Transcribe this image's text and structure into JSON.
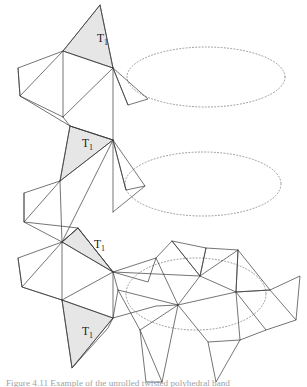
{
  "figure": {
    "caption": "Figure 4.11 Example of the unrolled twisted polyhedral band",
    "stroke_color": "#3a3a3a",
    "shade_color": "#e6e6e6",
    "dotted_color": "#8a8a8a",
    "background": "#ffffff",
    "labels": [
      {
        "id": "label-t1-top",
        "text": "T",
        "subscript": "1",
        "x": 97,
        "y": 42
      },
      {
        "id": "label-t1-second",
        "text": "T",
        "subscript": "1",
        "x": 82,
        "y": 147
      },
      {
        "id": "label-t1-third",
        "text": "T",
        "subscript": "1",
        "x": 94,
        "y": 248
      },
      {
        "id": "label-t1-fourth",
        "text": "T",
        "subscript": "1",
        "x": 82,
        "y": 335
      }
    ],
    "shaded_triangles": [
      {
        "id": "shaded-triangle-1",
        "points": "100,5 63,51 113,68"
      },
      {
        "id": "shaded-triangle-2",
        "points": "70,126 113,140 60,181"
      },
      {
        "id": "shaded-triangle-3",
        "points": "78,228 113,272 62,242"
      },
      {
        "id": "shaded-triangle-4",
        "points": "62,300 113,318 72,368"
      }
    ],
    "ellipses": [
      {
        "id": "cross-section-ellipse-1",
        "cx": 206,
        "cy": 77,
        "rx": 79,
        "ry": 30
      },
      {
        "id": "cross-section-ellipse-2",
        "cx": 203,
        "cy": 184,
        "rx": 78,
        "ry": 32
      },
      {
        "id": "cross-section-ellipse-3",
        "cx": 196,
        "cy": 294,
        "rx": 70,
        "ry": 36
      }
    ],
    "mesh_polylines": [
      {
        "id": "strip-seg-a1",
        "points": "100,5 63,51 113,68 100,5"
      },
      {
        "id": "strip-seg-a2",
        "points": "63,51 18,68 20,96 63,51"
      },
      {
        "id": "strip-seg-a3",
        "points": "18,68 20,96 63,117"
      },
      {
        "id": "strip-seg-a4",
        "points": "63,51 63,117"
      },
      {
        "id": "strip-seg-a5",
        "points": "63,117 113,68"
      },
      {
        "id": "strip-seg-a6",
        "points": "113,68 113,140"
      },
      {
        "id": "strip-seg-a7",
        "points": "63,117 70,126 113,140"
      },
      {
        "id": "strip-seg-a8",
        "points": "113,68 148,99 128,105 113,68"
      },
      {
        "id": "strip-seg-a9",
        "points": "113,68 128,105"
      },
      {
        "id": "strip-seg-a10",
        "points": "20,96 70,126"
      },
      {
        "id": "strip-seg-b1",
        "points": "70,126 113,140 60,181 70,126"
      },
      {
        "id": "strip-seg-b2",
        "points": "60,181 24,193 24,222 60,181"
      },
      {
        "id": "strip-seg-b3",
        "points": "24,193 24,222 62,242"
      },
      {
        "id": "strip-seg-b4",
        "points": "60,181 62,242"
      },
      {
        "id": "strip-seg-b5",
        "points": "62,242 113,140"
      },
      {
        "id": "strip-seg-b6",
        "points": "113,140 113,212"
      },
      {
        "id": "strip-seg-b7",
        "points": "113,140 145,186 126,190 113,140"
      },
      {
        "id": "strip-seg-b8",
        "points": "113,140 126,190"
      },
      {
        "id": "strip-seg-b9",
        "points": "24,222 78,228"
      },
      {
        "id": "strip-seg-b10",
        "points": "62,242 78,228 113,272"
      },
      {
        "id": "strip-seg-b11",
        "points": "113,212 145,186"
      },
      {
        "id": "strip-seg-c1",
        "points": "78,228 113,272 62,242 78,228"
      },
      {
        "id": "strip-seg-c2",
        "points": "62,242 18,258 22,287 62,242"
      },
      {
        "id": "strip-seg-c3",
        "points": "18,258 22,287 62,300"
      },
      {
        "id": "strip-seg-c4",
        "points": "62,242 62,300"
      },
      {
        "id": "strip-seg-c5",
        "points": "62,300 113,272"
      },
      {
        "id": "strip-seg-c6",
        "points": "113,272 113,318"
      },
      {
        "id": "strip-seg-c7",
        "points": "62,300 72,368 113,318 62,300"
      },
      {
        "id": "strip-seg-c8",
        "points": "72,368 108,328 113,318"
      },
      {
        "id": "strip-seg-c9",
        "points": "22,287 62,300"
      },
      {
        "id": "unroll-1",
        "points": "113,272 156,258 178,305 118,290 113,272"
      },
      {
        "id": "unroll-2",
        "points": "156,258 172,241 200,276 178,305"
      },
      {
        "id": "unroll-3",
        "points": "172,241 200,276 206,248 172,241"
      },
      {
        "id": "unroll-4",
        "points": "200,276 238,250 236,292 200,276"
      },
      {
        "id": "unroll-5",
        "points": "238,250 270,290 236,292 238,250"
      },
      {
        "id": "unroll-6",
        "points": "270,290 300,276 296,320 270,290"
      },
      {
        "id": "unroll-7",
        "points": "236,292 266,330 240,340 236,292"
      },
      {
        "id": "unroll-8",
        "points": "178,305 208,342 240,340"
      },
      {
        "id": "unroll-9",
        "points": "118,290 140,330 178,305"
      },
      {
        "id": "unroll-10",
        "points": "140,330 162,382 178,305"
      },
      {
        "id": "unroll-11",
        "points": "140,330 146,382 162,382"
      },
      {
        "id": "unroll-12",
        "points": "208,342 216,382 240,340"
      },
      {
        "id": "unroll-13",
        "points": "113,318 156,306 178,305"
      },
      {
        "id": "unroll-14",
        "points": "113,272 148,282 156,258"
      },
      {
        "id": "unroll-15",
        "points": "236,292 270,290"
      },
      {
        "id": "unroll-16",
        "points": "266,330 296,320"
      },
      {
        "id": "unroll-17",
        "points": "206,248 238,250"
      },
      {
        "id": "unroll-18",
        "points": "113,318 118,290"
      },
      {
        "id": "unroll-19",
        "points": "200,276 206,248"
      },
      {
        "id": "unroll-20",
        "points": "178,305 236,292"
      },
      {
        "id": "unroll-21",
        "points": "113,272 200,276"
      }
    ]
  }
}
